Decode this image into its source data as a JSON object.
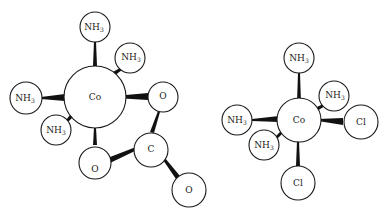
{
  "diagram": {
    "molecules": [
      {
        "name": "carbonato-tetraammine-cobalt",
        "center": {
          "label": "Co"
        },
        "ligands": [
          {
            "label": "NH",
            "sub": "3",
            "position": "top"
          },
          {
            "label": "NH",
            "sub": "3",
            "position": "upper-right"
          },
          {
            "label": "NH",
            "sub": "3",
            "position": "left"
          },
          {
            "label": "NH",
            "sub": "3",
            "position": "lower-left"
          },
          {
            "label": "O",
            "sub": "",
            "position": "right"
          },
          {
            "label": "O",
            "sub": "",
            "position": "bottom"
          },
          {
            "label": "C",
            "sub": "",
            "position": "carbonate-carbon"
          },
          {
            "label": "O",
            "sub": "",
            "position": "carbonate-terminal"
          }
        ]
      },
      {
        "name": "dichloro-tetraammine-cobalt",
        "center": {
          "label": "Co"
        },
        "ligands": [
          {
            "label": "NH",
            "sub": "3",
            "position": "top"
          },
          {
            "label": "NH",
            "sub": "3",
            "position": "upper-right"
          },
          {
            "label": "NH",
            "sub": "3",
            "position": "left"
          },
          {
            "label": "NH",
            "sub": "3",
            "position": "lower-left"
          },
          {
            "label": "Cl",
            "sub": "",
            "position": "right"
          },
          {
            "label": "Cl",
            "sub": "",
            "position": "bottom"
          }
        ]
      }
    ]
  }
}
